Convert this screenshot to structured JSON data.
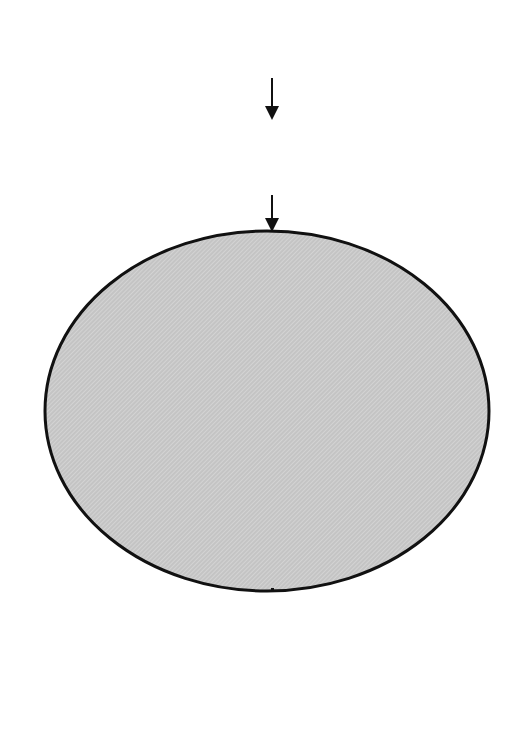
{
  "macro": {
    "title": "MACRO-ECONOMY",
    "lines": [
      "Changes in global, national,",
      "and sectoral economies",
      "(Ch. 1)"
    ]
  },
  "theories": {
    "title": "THEORIES",
    "lines": [
      "Economic location",
      "and change",
      "(Chs. 2, 10, 14, and 15)"
    ]
  },
  "context": {
    "top_label": "CONTEXT",
    "bottom_label_1": "OF",
    "bottom_label_2": "CHANGE",
    "center": {
      "lines": [
        "LOCATION AND",
        "LAND-USE DECISION-",
        "MAKING",
        "(Ch. 10)"
      ]
    },
    "factors": [
      {
        "id": "factors-of-production",
        "lines": [
          "Factors",
          "of",
          "production",
          "(Ch. 4)"
        ]
      },
      {
        "id": "physical-context",
        "lines": [
          "Physical",
          "context",
          "(Ch. 3)"
        ]
      },
      {
        "id": "demand-transport-linkages",
        "lines": [
          "Demand,",
          "transport,",
          "and linkages",
          "(Ch. 5)"
        ]
      },
      {
        "id": "technological-context",
        "lines": [
          "Technological",
          "context",
          "(Ch. 6)"
        ]
      },
      {
        "id": "organisational-context",
        "lines": [
          "Organisational",
          "context",
          "(Ch. 7)"
        ]
      },
      {
        "id": "political-context",
        "lines": [
          "Political",
          "context",
          "(Ch. 8)"
        ]
      },
      {
        "id": "social-cultural-context",
        "lines": [
          "Social and",
          "cultural",
          "context",
          "(Ch. 9)"
        ]
      }
    ]
  },
  "space_economy": {
    "title": "SPACE ECONOMY",
    "left_box": {
      "lines": [
        "Changes in spatial patterns",
        "of primary manufacturing",
        "and service activities",
        "(Chs. 11-13)"
      ]
    },
    "right_box": {
      "lines": [
        "The geography of economic",
        "change and",
        "environmental impacts",
        "(Chs. 14-17)"
      ]
    },
    "footer": "INTERNATIONAL, REGIONAL, AND LOCAL RESPONSES"
  },
  "feedback_label": "FEEDBACK",
  "colors": {
    "line": "#111111",
    "fill_gray": "#c9c9c9",
    "box_white": "#ffffff"
  }
}
